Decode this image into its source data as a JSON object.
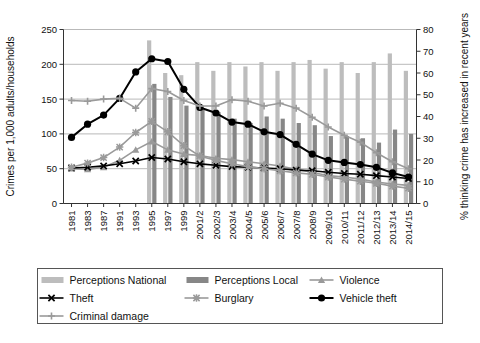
{
  "chart_data": {
    "type": "bar",
    "title": "",
    "subtitle": "",
    "xlabel": "",
    "ylabel": "Crimes per 1,000 adults/households",
    "y2label": "% thinking crime has increased in recent years",
    "ylim": [
      0,
      250
    ],
    "y2lim": [
      0,
      80
    ],
    "yticks": [
      "0",
      "50",
      "100",
      "150",
      "200",
      "250"
    ],
    "y2ticks": [
      "0",
      "10",
      "20",
      "30",
      "40",
      "50",
      "60",
      "70",
      "80"
    ],
    "grid": true,
    "legend_position": "bottom",
    "categories": [
      "1981",
      "1983",
      "1987",
      "1991",
      "1993",
      "1995",
      "1997",
      "1999",
      "2001/2",
      "2002/3",
      "2003/4",
      "2004/5",
      "2005/6",
      "2006/7",
      "2007/8",
      "2008/9",
      "2009/10",
      "2010/11",
      "2011/12",
      "2012/13",
      "2013/14",
      "2014/15"
    ],
    "bar_series": [
      {
        "name": "Perceptions National",
        "axis": "right",
        "color": "#bdbdbd",
        "values": [
          null,
          null,
          null,
          null,
          null,
          75,
          60,
          59,
          65,
          61,
          65,
          63,
          65,
          61,
          65,
          66,
          62,
          65,
          60,
          65,
          69,
          61
        ]
      },
      {
        "name": "Perceptions Local",
        "axis": "right",
        "color": "#878787",
        "values": [
          null,
          null,
          null,
          null,
          null,
          55,
          49,
          45,
          43,
          42,
          39,
          37,
          40,
          39,
          37,
          36,
          31,
          31,
          30,
          28,
          34,
          32
        ]
      }
    ],
    "line_series": [
      {
        "name": "Violence",
        "axis": "left",
        "color": "#9a9a9a",
        "marker": "triangle",
        "values": [
          50,
          49,
          52,
          62,
          77,
          89,
          77,
          71,
          69,
          65,
          63,
          60,
          57,
          54,
          49,
          45,
          40,
          38,
          35,
          31,
          28,
          26
        ]
      },
      {
        "name": "Theft",
        "axis": "left",
        "color": "#000000",
        "marker": "x",
        "values": [
          51,
          52,
          54,
          57,
          61,
          66,
          64,
          60,
          57,
          55,
          53,
          52,
          51,
          50,
          48,
          47,
          45,
          43,
          42,
          40,
          38,
          36
        ]
      },
      {
        "name": "Burglary",
        "axis": "left",
        "color": "#9a9a9a",
        "marker": "star",
        "values": [
          52,
          58,
          66,
          81,
          102,
          118,
          103,
          83,
          68,
          62,
          57,
          53,
          50,
          47,
          44,
          42,
          38,
          35,
          32,
          29,
          25,
          22
        ]
      },
      {
        "name": "Vehicle theft",
        "axis": "left",
        "color": "#000000",
        "marker": "circle",
        "values": [
          95,
          114,
          127,
          151,
          189,
          208,
          204,
          164,
          138,
          130,
          117,
          114,
          103,
          99,
          85,
          71,
          62,
          59,
          56,
          52,
          44,
          38
        ]
      },
      {
        "name": "Criminal damage",
        "axis": "left",
        "color": "#9a9a9a",
        "marker": "plus",
        "values": [
          148,
          147,
          150,
          151,
          137,
          165,
          161,
          148,
          140,
          140,
          149,
          147,
          140,
          144,
          137,
          124,
          110,
          98,
          88,
          73,
          60,
          50
        ]
      }
    ],
    "legend_entries": [
      {
        "label": "Perceptions National",
        "type": "bar",
        "color": "#bdbdbd"
      },
      {
        "label": "Perceptions Local",
        "type": "bar",
        "color": "#878787"
      },
      {
        "label": "Violence",
        "type": "line",
        "color": "#9a9a9a",
        "marker": "triangle"
      },
      {
        "label": "Theft",
        "type": "line",
        "color": "#000000",
        "marker": "x"
      },
      {
        "label": "Burglary",
        "type": "line",
        "color": "#9a9a9a",
        "marker": "star"
      },
      {
        "label": "Vehicle theft",
        "type": "line",
        "color": "#000000",
        "marker": "circle"
      },
      {
        "label": "Criminal damage",
        "type": "line",
        "color": "#9a9a9a",
        "marker": "plus"
      }
    ]
  }
}
